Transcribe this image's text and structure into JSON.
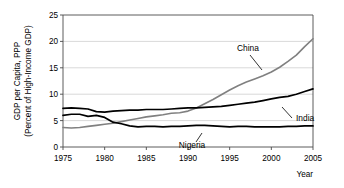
{
  "chart_data": {
    "type": "line",
    "title": "",
    "xlabel": "Year",
    "ylabel": "GDP per Capita, PPP (Percent of High-Income GDP)",
    "ylabel_line1": "GDP per Capita, PPP",
    "ylabel_line2": "(Percent of High-Income GDP)",
    "xlim": [
      1975,
      2005
    ],
    "ylim": [
      0,
      25
    ],
    "yticks": [
      0,
      5,
      10,
      15,
      20,
      25
    ],
    "ytick_labels": [
      "0",
      "5",
      "10",
      "15",
      "20",
      "25"
    ],
    "xticks": [
      1975,
      1980,
      1985,
      1990,
      1995,
      2000,
      2005
    ],
    "xtick_labels": [
      "1975",
      "1980",
      "1985",
      "1990",
      "1995",
      "2000",
      "2005"
    ],
    "grid": "horizontal",
    "legend_position": "inline-annotations",
    "x": [
      1975,
      1976,
      1977,
      1978,
      1979,
      1980,
      1981,
      1982,
      1983,
      1984,
      1985,
      1986,
      1987,
      1988,
      1989,
      1990,
      1991,
      1992,
      1993,
      1994,
      1995,
      1996,
      1997,
      1998,
      1999,
      2000,
      2001,
      2002,
      2003,
      2004,
      2005
    ],
    "series": [
      {
        "name": "China",
        "color": "#808080",
        "values": [
          3.7,
          3.6,
          3.7,
          3.9,
          4.1,
          4.3,
          4.5,
          4.8,
          5.1,
          5.4,
          5.7,
          5.9,
          6.1,
          6.4,
          6.5,
          6.8,
          7.4,
          8.2,
          9.0,
          9.9,
          10.8,
          11.6,
          12.3,
          12.9,
          13.5,
          14.2,
          15.1,
          16.2,
          17.4,
          19.0,
          20.5
        ]
      },
      {
        "name": "India",
        "color": "#000000",
        "values": [
          7.3,
          7.4,
          7.3,
          7.2,
          6.7,
          6.6,
          6.8,
          6.9,
          7.0,
          7.0,
          7.1,
          7.1,
          7.1,
          7.2,
          7.3,
          7.4,
          7.4,
          7.5,
          7.6,
          7.7,
          7.9,
          8.1,
          8.3,
          8.5,
          8.8,
          9.1,
          9.4,
          9.6,
          10.0,
          10.5,
          11.0
        ]
      },
      {
        "name": "Nigeria",
        "color": "#000000",
        "values": [
          6.0,
          6.2,
          6.2,
          5.8,
          6.0,
          5.6,
          4.7,
          4.4,
          4.0,
          3.8,
          3.9,
          3.9,
          3.8,
          3.9,
          3.9,
          4.0,
          4.1,
          4.1,
          4.0,
          3.9,
          3.8,
          3.9,
          3.9,
          3.8,
          3.8,
          3.8,
          3.8,
          3.9,
          3.9,
          4.0,
          4.0
        ]
      }
    ],
    "annotations": [
      {
        "text": "China",
        "x_px": 248,
        "y_px": 51
      },
      {
        "text": "India",
        "x_px": 296,
        "y_px": 121
      },
      {
        "text": "Nigeria",
        "x_px": 192,
        "y_px": 148
      }
    ]
  }
}
